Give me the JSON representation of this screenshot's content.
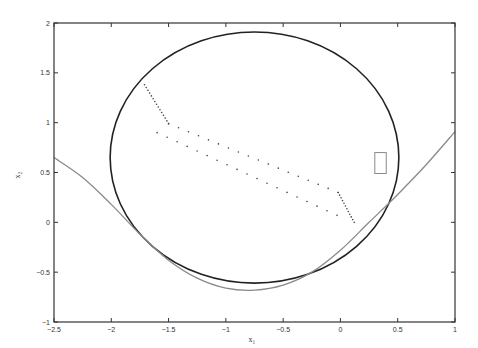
{
  "chart_data": {
    "type": "line",
    "title": "",
    "xlabel": "x₁",
    "ylabel": "x₂",
    "xlim": [
      -2.5,
      1
    ],
    "ylim": [
      -1,
      2
    ],
    "grid": false,
    "legend": null,
    "xticks": [
      -2.5,
      -2,
      -1.5,
      -1,
      -0.5,
      0,
      0.5,
      1
    ],
    "xtick_labels": [
      "-2.5",
      "-2",
      "-1.5",
      "-1",
      "-0.5",
      "0",
      "0.5",
      "1"
    ],
    "yticks": [
      -1,
      -0.5,
      0,
      0.5,
      1,
      1.5,
      2
    ],
    "ytick_labels": [
      "-1",
      "-0.5",
      "0",
      "0.5",
      "1",
      "1.5",
      "2"
    ],
    "series": [
      {
        "name": "circle",
        "style": "solid",
        "color": "#222222",
        "shape": "circle",
        "center": [
          -0.75,
          0.65
        ],
        "radius": 1.26
      },
      {
        "name": "boundary-curve",
        "style": "solid",
        "color": "#8a8a8a",
        "x": [
          -2.5,
          -2.25,
          -2.0,
          -1.75,
          -1.5,
          -1.25,
          -1.0,
          -0.75,
          -0.5,
          -0.25,
          0.0,
          0.25,
          0.5,
          0.75,
          1.0
        ],
        "y": [
          0.65,
          0.45,
          0.18,
          -0.12,
          -0.38,
          -0.56,
          -0.66,
          -0.68,
          -0.63,
          -0.5,
          -0.28,
          0.0,
          0.28,
          0.58,
          0.91
        ]
      },
      {
        "name": "trajectory-1",
        "style": "dotted",
        "color": "#444444",
        "x": [
          -1.71,
          -1.5,
          -0.02,
          0.12
        ],
        "y": [
          1.38,
          0.99,
          0.3,
          0.0
        ]
      },
      {
        "name": "trajectory-2",
        "style": "dotted",
        "color": "#444444",
        "x": [
          -1.6,
          -0.03
        ],
        "y": [
          0.9,
          0.07
        ]
      },
      {
        "name": "target-rectangle",
        "style": "solid",
        "color": "#8a8a8a",
        "shape": "rect",
        "x": [
          0.3,
          0.4
        ],
        "y": [
          0.49,
          0.7
        ]
      }
    ]
  }
}
